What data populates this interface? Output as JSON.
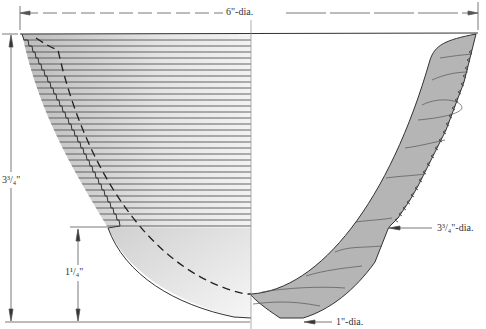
{
  "diagram": {
    "type": "bowl-profile-drawing",
    "top_caption_partial": "…p…s…, … g…",
    "dimensions": {
      "top_diameter": "6\"-dia.",
      "overall_height": "3³/₄\"",
      "lower_height": "1¹/₄\"",
      "mid_diameter": "3³/₄\"-dia.",
      "foot_diameter": "1\"-dia."
    },
    "halves": {
      "left": "exterior view with stepped turning rings",
      "right": "cross-section of wall with wood grain"
    },
    "colors": {
      "outline": "#333333",
      "section_fill": "#b3b3b3",
      "exterior_fill": "#d9d9d9",
      "ring_lines": "#555555",
      "dimension_lines": "#555555"
    }
  }
}
